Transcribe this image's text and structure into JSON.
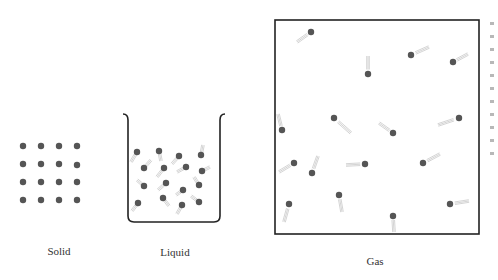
{
  "figure": {
    "colors": {
      "particle": "#555555",
      "outline": "#222222",
      "trail": "#c9c9c9",
      "label_text": "#333333"
    },
    "panels": [
      {
        "id": "solid",
        "label": "Solid",
        "label_pos": [
          59,
          253
        ],
        "particles": [
          [
            23,
            146
          ],
          [
            41,
            146
          ],
          [
            59,
            146
          ],
          [
            77,
            146
          ],
          [
            23,
            164
          ],
          [
            41,
            164
          ],
          [
            59,
            164
          ],
          [
            77,
            165
          ],
          [
            23,
            182
          ],
          [
            41,
            182
          ],
          [
            59,
            182
          ],
          [
            77,
            182
          ],
          [
            23,
            200
          ],
          [
            41,
            200
          ],
          [
            59,
            200
          ],
          [
            77,
            200
          ]
        ]
      },
      {
        "id": "liquid",
        "label": "Liquid",
        "label_pos": [
          175,
          254
        ],
        "container": "beaker",
        "particles": [
          {
            "p": [
              137,
              152
            ],
            "t": [
              -6,
              10
            ]
          },
          {
            "p": [
              159,
              151
            ],
            "t": [
              2,
              10
            ]
          },
          {
            "p": [
              179,
              156
            ],
            "t": [
              -7,
              8
            ]
          },
          {
            "p": [
              201,
              155
            ],
            "t": [
              2,
              -10
            ]
          },
          {
            "p": [
              144,
              168
            ],
            "t": [
              7,
              -8
            ]
          },
          {
            "p": [
              164,
              168
            ],
            "t": [
              -7,
              9
            ]
          },
          {
            "p": [
              186,
              167
            ],
            "t": [
              -9,
              5
            ]
          },
          {
            "p": [
              202,
              171
            ],
            "t": [
              8,
              -4
            ]
          },
          {
            "p": [
              144,
              186
            ],
            "t": [
              -7,
              -6
            ]
          },
          {
            "p": [
              166,
              183
            ],
            "t": [
              -8,
              7
            ]
          },
          {
            "p": [
              183,
              190
            ],
            "t": [
              -7,
              5
            ]
          },
          {
            "p": [
              199,
              185
            ],
            "t": [
              -5,
              -8
            ]
          },
          {
            "p": [
              138,
              203
            ],
            "t": [
              -6,
              8
            ]
          },
          {
            "p": [
              163,
              198
            ],
            "t": [
              6,
              8
            ]
          },
          {
            "p": [
              182,
              205
            ],
            "t": [
              -5,
              9
            ]
          },
          {
            "p": [
              199,
              202
            ],
            "t": [
              -8,
              -6
            ]
          }
        ]
      },
      {
        "id": "gas",
        "label": "Gas",
        "label_pos": [
          375,
          263
        ],
        "container": "box",
        "box": [
          275,
          20,
          479,
          234
        ],
        "particles": [
          {
            "p": [
              311,
              32
            ],
            "t": [
              -14,
              10
            ]
          },
          {
            "p": [
              411,
              55
            ],
            "t": [
              18,
              -8
            ]
          },
          {
            "p": [
              453,
              62
            ],
            "t": [
              15,
              -8
            ]
          },
          {
            "p": [
              368,
              74
            ],
            "t": [
              0,
              -18
            ]
          },
          {
            "p": [
              282,
              130
            ],
            "t": [
              -4,
              -16
            ]
          },
          {
            "p": [
              334,
              118
            ],
            "t": [
              17,
              15
            ]
          },
          {
            "p": [
              393,
              133
            ],
            "t": [
              -14,
              -10
            ]
          },
          {
            "p": [
              459,
              118
            ],
            "t": [
              -21,
              7
            ]
          },
          {
            "p": [
              294,
              163
            ],
            "t": [
              -15,
              9
            ]
          },
          {
            "p": [
              312,
              173
            ],
            "t": [
              6,
              -17
            ]
          },
          {
            "p": [
              365,
              164
            ],
            "t": [
              -19,
              1
            ]
          },
          {
            "p": [
              423,
              163
            ],
            "t": [
              17,
              -9
            ]
          },
          {
            "p": [
              289,
              204
            ],
            "t": [
              -5,
              18
            ]
          },
          {
            "p": [
              339,
              195
            ],
            "t": [
              3,
              17
            ]
          },
          {
            "p": [
              393,
              216
            ],
            "t": [
              1,
              16
            ]
          },
          {
            "p": [
              450,
              204
            ],
            "t": [
              19,
              -3
            ]
          }
        ]
      }
    ],
    "clipped_edge_text_lines": 11
  }
}
